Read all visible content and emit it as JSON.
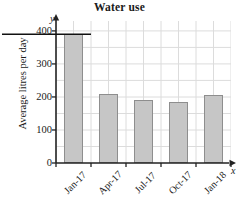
{
  "chart_data": {
    "type": "bar",
    "title": "Water use",
    "xlabel": "x",
    "ylabel": "Average litres per day",
    "categories": [
      "Jan-17",
      "Apr-17",
      "Jul-17",
      "Oct-17",
      "Jan-18"
    ],
    "values": [
      390,
      208,
      190,
      184,
      205
    ],
    "ylim": [
      0,
      430
    ],
    "ytick_values": [
      0,
      100,
      200,
      300,
      400
    ],
    "ytick_labels": [
      "0",
      "100",
      "200",
      "300",
      "400"
    ],
    "grid": true,
    "grid_minor_y_step": 50,
    "legend": null,
    "annotations": [
      {
        "name": "reference-line",
        "description": "horizontal rule drawn across at the top of the first bar",
        "y_value": 390
      }
    ],
    "axis_letters": {
      "y": "y",
      "x": "x"
    },
    "colors": {
      "bar_fill": "#c6c6c6",
      "bar_stroke": "#8e8e8e",
      "grid": "#d9d9d9",
      "axis": "#222222",
      "text": "#1a1a1a",
      "background": "#ffffff"
    }
  }
}
